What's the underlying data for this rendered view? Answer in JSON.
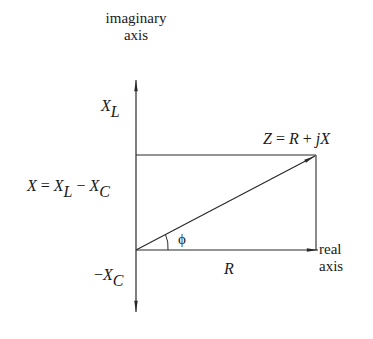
{
  "diagram": {
    "colors": {
      "line": "#2a2a2a",
      "text": "#1a1a1a",
      "background": "#ffffff"
    },
    "axes": {
      "imaginary": {
        "line1": "imaginary",
        "line2": "axis"
      },
      "real": {
        "line1": "real",
        "line2": "axis"
      }
    },
    "labels": {
      "xl_main": "X",
      "xl_sub": "L",
      "x_eq_main": "X",
      "x_eq_eq": " = ",
      "x_eq_xl": "X",
      "x_eq_xl_sub": "L",
      "x_eq_minus": " − ",
      "x_eq_xc": "X",
      "x_eq_xc_sub": "C",
      "neg_xc_minus": "−",
      "neg_xc_main": "X",
      "neg_xc_sub": "C",
      "z_Z": "Z",
      "z_eq": " = ",
      "z_R": "R",
      "z_plus": " + ",
      "z_j": "j",
      "z_X": "X",
      "phi": "ϕ",
      "r": "R"
    }
  }
}
